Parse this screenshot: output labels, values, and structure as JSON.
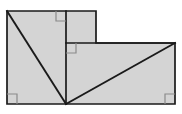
{
  "figure": {
    "canvas": {
      "width": 182,
      "height": 114,
      "background": "#ffffff"
    },
    "style": {
      "fill": "#d4d4d4",
      "stroke": "#1a1a1a",
      "stroke_width": 1.7,
      "diagonal_stroke_width": 1.9,
      "right_angle_mark_stroke": "#8a8a8a",
      "right_angle_mark_stroke_width": 1.2,
      "right_angle_mark_size": 10
    },
    "outline": {
      "name": "stepped-polygon",
      "points": "7,11 96,11 96,43 175,43 175,104 7,104",
      "vertices": [
        {
          "label": "A",
          "x": 7,
          "y": 11
        },
        {
          "label": "B",
          "x": 96,
          "y": 11
        },
        {
          "label": "C",
          "x": 96,
          "y": 43
        },
        {
          "label": "D",
          "x": 175,
          "y": 43
        },
        {
          "label": "E",
          "x": 175,
          "y": 104
        },
        {
          "label": "F",
          "x": 7,
          "y": 104
        }
      ]
    },
    "internal_lines": [
      {
        "name": "vertical-divider",
        "x1": 66,
        "y1": 11,
        "x2": 66,
        "y2": 104,
        "weight": "normal"
      },
      {
        "name": "horizontal-divider",
        "x1": 66,
        "y1": 43,
        "x2": 175,
        "y2": 43,
        "weight": "normal"
      },
      {
        "name": "diagonal-left",
        "x1": 7,
        "y1": 11,
        "x2": 66,
        "y2": 104,
        "weight": "heavy"
      },
      {
        "name": "diagonal-right",
        "x1": 66,
        "y1": 104,
        "x2": 175,
        "y2": 43,
        "weight": "heavy"
      }
    ],
    "right_angle_marks": [
      {
        "name": "right-angle-top-step",
        "x": 66,
        "y": 11,
        "dx": -1,
        "dy": 1
      },
      {
        "name": "right-angle-inner-step",
        "x": 66,
        "y": 43,
        "dx": 1,
        "dy": 1
      },
      {
        "name": "right-angle-bottom-left",
        "x": 7,
        "y": 104,
        "dx": 1,
        "dy": -1
      },
      {
        "name": "right-angle-bottom-right",
        "x": 175,
        "y": 104,
        "dx": -1,
        "dy": -1
      }
    ],
    "apex_vertex": {
      "name": "diagonal-apex",
      "x": 66,
      "y": 104
    }
  }
}
